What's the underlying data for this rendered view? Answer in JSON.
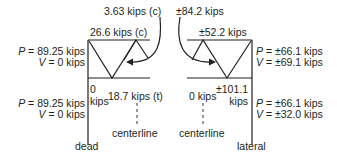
{
  "diagram": {
    "type": "truss-member-forces",
    "line_color": "#231f20",
    "dead": {
      "caption": "dead",
      "top_member_force": "26.6 kips (c)",
      "diagonal_callout": "3.63 kips (c)",
      "upper_support": {
        "P": "89.25 kips",
        "V": "0 kips"
      },
      "lower_support": {
        "P": "89.25 kips",
        "V": "0 kips"
      },
      "bottom_left_force_value": "0",
      "bottom_left_force_unit": "kips",
      "bottom_chord_force": "18.7 kips (t)",
      "centerline_label": "centerline"
    },
    "lateral": {
      "caption": "lateral",
      "top_member_force": "±52.2 kips",
      "diagonal_callout": "±84.2 kips",
      "upper_support": {
        "P": "±66.1 kips",
        "V": "±69.1 kips"
      },
      "lower_support": {
        "P": "±66.1 kips",
        "V": "±32.0 kips"
      },
      "bottom_chord_force": "0 kips",
      "bottom_right_force_value": "±101.1",
      "bottom_right_force_unit": "kips",
      "centerline_label": "centerline"
    },
    "symbols": {
      "P": "P",
      "V": "V",
      "eq": " = "
    }
  }
}
